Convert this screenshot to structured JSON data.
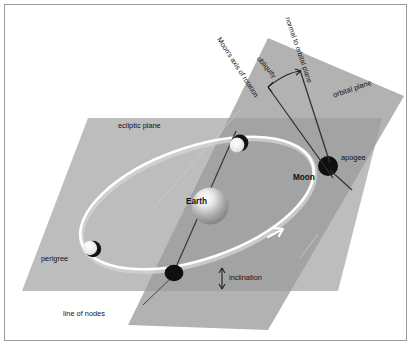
{
  "figure": {
    "background_color": "#ffffff",
    "frame_color": "#9a9a9a"
  },
  "colors": {
    "ecliptic_plane": "#b9b9b9",
    "orbital_plane": "#a8a8a8",
    "plane_overlap": "#9d9d9d",
    "orbit_path": "#ffffff",
    "orbit_shadow": "#d7d7d7",
    "axis_line": "#333333",
    "moon_dark": "#111111",
    "moon_light": "#f2f2f2",
    "earth_body": "#9a9a9a",
    "earth_highlight": "#ffffff",
    "text": "#111111"
  },
  "labels": {
    "ecliptic_plane": "ecliptic plane",
    "orbital_plane": "orbital plane",
    "moons_axis_of_rotation": "Moon's axis of rotation",
    "normal_to_orbital_plane": "normal to orbital plane",
    "obliquity": "obliquity",
    "inclination": "inclination",
    "line_of_nodes": "line of nodes",
    "earth": "Earth",
    "moon": "Moon",
    "apogee": "apogee",
    "perigee": "perigree"
  },
  "diagram_data": {
    "type": "diagram",
    "subject": "Lunar orbit about the Earth",
    "planes": [
      {
        "name": "ecliptic plane",
        "orientation": "horizontal reference plane",
        "fill": "#b9b9b9"
      },
      {
        "name": "orbital plane",
        "orientation": "tilted, inclined to the ecliptic",
        "fill": "#a8a8a8"
      }
    ],
    "bodies": [
      {
        "name": "Earth",
        "role": "primary, at focus of orbit",
        "style": "shaded sphere"
      },
      {
        "name": "Moon",
        "role": "satellite shown at apogee",
        "style": "filled dark disc"
      }
    ],
    "orbit_points": [
      {
        "name": "apogee",
        "description": "farthest point of the Moon's orbit from Earth"
      },
      {
        "name": "perigree",
        "description": "nearest point of the Moon's orbit to Earth"
      },
      {
        "name": "ascending node",
        "description": "orbit crosses the ecliptic plane, upper left of Moon"
      },
      {
        "name": "descending node",
        "description": "orbit crosses the ecliptic plane, lower centre"
      }
    ],
    "annotated_angles": [
      {
        "name": "obliquity",
        "between": [
          "Moon's axis of rotation",
          "normal to orbital plane"
        ],
        "marker": "double-headed arc arrow"
      },
      {
        "name": "inclination",
        "between": [
          "orbital plane",
          "ecliptic plane"
        ],
        "marker": "vertical double-headed arrow"
      }
    ],
    "reference_lines": [
      {
        "name": "line of nodes",
        "description": "intersection of orbital plane and ecliptic plane through Earth"
      },
      {
        "name": "Moon's axis of rotation",
        "description": "spin axis of the Moon"
      },
      {
        "name": "normal to orbital plane",
        "description": "perpendicular to the Moon's orbital plane"
      }
    ],
    "orbit_direction": "counter-clockwise as viewed (arrow on lower-right of orbit path)"
  }
}
